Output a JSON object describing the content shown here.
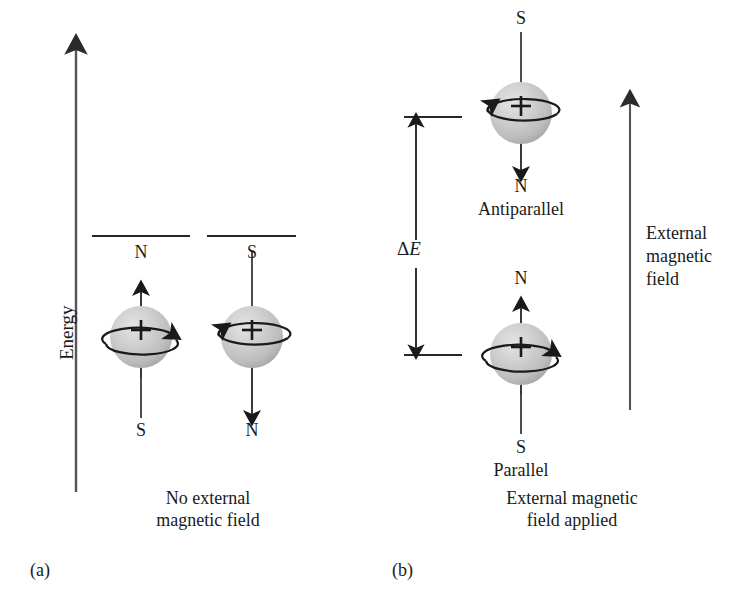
{
  "figure": {
    "background_color": "#ffffff",
    "ink_color": "#1a1a1a",
    "sphere_color": "#c9c9c9",
    "sphere_highlight": "#e2e2e2",
    "sphere_shadow": "#9a9a9a"
  },
  "axis": {
    "energy_label": "Energy"
  },
  "panel_a": {
    "tag": "(a)",
    "caption": "No external\nmagnetic field",
    "nuclei": [
      {
        "top_pole": "N",
        "bottom_pole": "S",
        "charge": "+",
        "moment_direction": "up",
        "spin_direction": "clockwise"
      },
      {
        "top_pole": "S",
        "bottom_pole": "N",
        "charge": "+",
        "moment_direction": "down",
        "spin_direction": "counterclockwise"
      }
    ]
  },
  "panel_b": {
    "tag": "(b)",
    "caption": "External magnetic\nfield applied",
    "energy_gap_label": "ΔE",
    "field_label": "External\nmagnetic\nfield",
    "states": [
      {
        "name": "Antiparallel",
        "top_pole": "S",
        "bottom_pole": "N",
        "charge": "+",
        "moment_direction": "down",
        "spin_direction": "counterclockwise",
        "level": "upper"
      },
      {
        "name": "Parallel",
        "top_pole": "N",
        "bottom_pole": "S",
        "charge": "+",
        "moment_direction": "up",
        "spin_direction": "clockwise",
        "level": "lower"
      }
    ]
  }
}
